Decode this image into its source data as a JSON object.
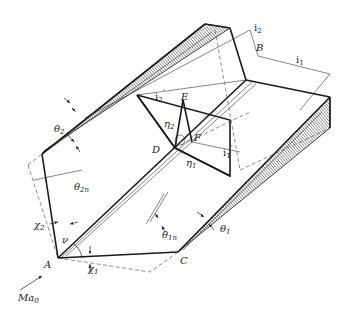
{
  "figure": {
    "points": {
      "A": "A",
      "B": "B",
      "C": "C",
      "D": "D",
      "E": "E",
      "F": "F"
    },
    "vectors": {
      "i1": "i",
      "i1_sub": "1",
      "i2": "i",
      "i2_sub": "2",
      "i1_prime": "i",
      "i1_prime_sub": "1",
      "i2_prime": "i",
      "i2_prime_sub": "2"
    },
    "angles": {
      "theta1": "θ",
      "theta1_sub": "1",
      "theta2": "θ",
      "theta2_sub": "2",
      "theta1n": "θ",
      "theta1n_sub": "1n",
      "theta2n": "θ",
      "theta2n_sub": "2n",
      "chi1": "χ",
      "chi1_sub": "1",
      "chi2": "χ",
      "chi2_sub": "2",
      "eta1": "η",
      "eta1_sub": "1",
      "eta2": "η",
      "eta2_sub": "2",
      "nu": "ν"
    },
    "freestream": {
      "label": "Ma",
      "sub": "0"
    },
    "colors": {
      "line": "#1a1a1a",
      "background": "#ffffff"
    }
  }
}
